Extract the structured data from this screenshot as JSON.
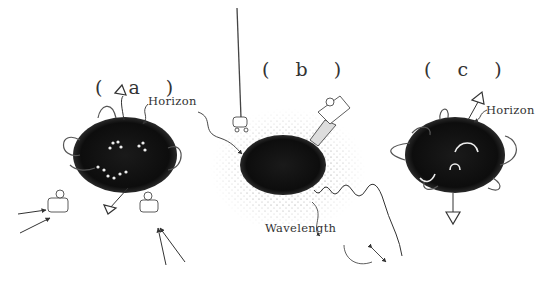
{
  "figure": {
    "panels": [
      {
        "id": "a",
        "label": "( a )",
        "annotations": [
          "Horizon"
        ]
      },
      {
        "id": "b",
        "label": "( b )",
        "annotations": [
          "Wavelength"
        ]
      },
      {
        "id": "c",
        "label": "( c )",
        "annotations": [
          "Horizon"
        ]
      }
    ]
  },
  "colors": {
    "background": "#ffffff",
    "black_hole": "#111111",
    "ink": "#333333",
    "halo_dots": "#888888"
  }
}
